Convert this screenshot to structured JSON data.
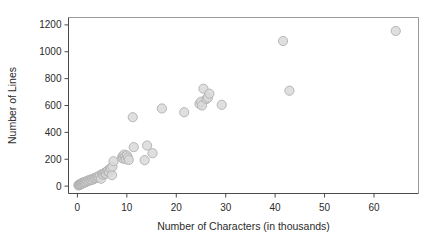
{
  "chart_data": {
    "type": "scatter",
    "title": "",
    "xlabel": "Number of Characters (in thousands)",
    "ylabel": "Number of Lines",
    "xlim": [
      -1.8,
      69.0
    ],
    "ylim": [
      -55,
      1255
    ],
    "xticks": [
      0,
      10,
      20,
      30,
      40,
      50,
      60
    ],
    "yticks": [
      0,
      200,
      400,
      600,
      800,
      1000,
      1200
    ],
    "xtick_labels": [
      "0",
      "10",
      "20",
      "30",
      "40",
      "50",
      "60"
    ],
    "ytick_labels": [
      "0",
      "200",
      "400",
      "600",
      "800",
      "1000",
      "1200"
    ],
    "grid": false,
    "legend": null,
    "marker": {
      "shape": "circle",
      "fill": "#d9d9d9",
      "edge": "#b0b0b0",
      "size": 4.6
    },
    "frame_color_top_right": "#9a9a9a",
    "frame_color_left_bottom": "#4a4a4a",
    "background": "#ffffff",
    "points": [
      [
        0.2,
        5
      ],
      [
        0.3,
        10
      ],
      [
        0.4,
        8
      ],
      [
        0.5,
        14
      ],
      [
        0.6,
        12
      ],
      [
        0.7,
        18
      ],
      [
        0.8,
        15
      ],
      [
        0.9,
        22
      ],
      [
        1.0,
        20
      ],
      [
        1.1,
        26
      ],
      [
        1.3,
        24
      ],
      [
        1.4,
        30
      ],
      [
        1.5,
        28
      ],
      [
        1.7,
        34
      ],
      [
        1.8,
        32
      ],
      [
        2.0,
        38
      ],
      [
        2.2,
        42
      ],
      [
        2.4,
        40
      ],
      [
        2.6,
        48
      ],
      [
        2.8,
        46
      ],
      [
        3.0,
        52
      ],
      [
        3.2,
        50
      ],
      [
        3.4,
        58
      ],
      [
        3.6,
        62
      ],
      [
        3.8,
        60
      ],
      [
        4.0,
        68
      ],
      [
        4.2,
        72
      ],
      [
        4.4,
        66
      ],
      [
        4.6,
        80
      ],
      [
        4.8,
        55
      ],
      [
        5.0,
        90
      ],
      [
        5.2,
        85
      ],
      [
        5.4,
        96
      ],
      [
        5.6,
        100
      ],
      [
        5.8,
        92
      ],
      [
        6.0,
        110
      ],
      [
        6.2,
        118
      ],
      [
        6.4,
        105
      ],
      [
        6.6,
        128
      ],
      [
        6.8,
        135
      ],
      [
        7.0,
        82
      ],
      [
        7.1,
        145
      ],
      [
        7.3,
        185
      ],
      [
        9.0,
        210
      ],
      [
        9.2,
        225
      ],
      [
        9.3,
        205
      ],
      [
        9.5,
        235
      ],
      [
        9.6,
        218
      ],
      [
        9.8,
        200
      ],
      [
        10.0,
        228
      ],
      [
        10.2,
        212
      ],
      [
        10.4,
        195
      ],
      [
        11.2,
        513
      ],
      [
        11.4,
        290
      ],
      [
        13.6,
        193
      ],
      [
        14.1,
        302
      ],
      [
        15.2,
        245
      ],
      [
        17.1,
        578
      ],
      [
        21.6,
        550
      ],
      [
        24.7,
        612
      ],
      [
        25.0,
        628
      ],
      [
        25.2,
        600
      ],
      [
        25.5,
        725
      ],
      [
        26.1,
        648
      ],
      [
        26.4,
        658
      ],
      [
        26.7,
        688
      ],
      [
        29.2,
        605
      ],
      [
        41.6,
        1080
      ],
      [
        42.9,
        710
      ],
      [
        64.4,
        1155
      ]
    ]
  }
}
